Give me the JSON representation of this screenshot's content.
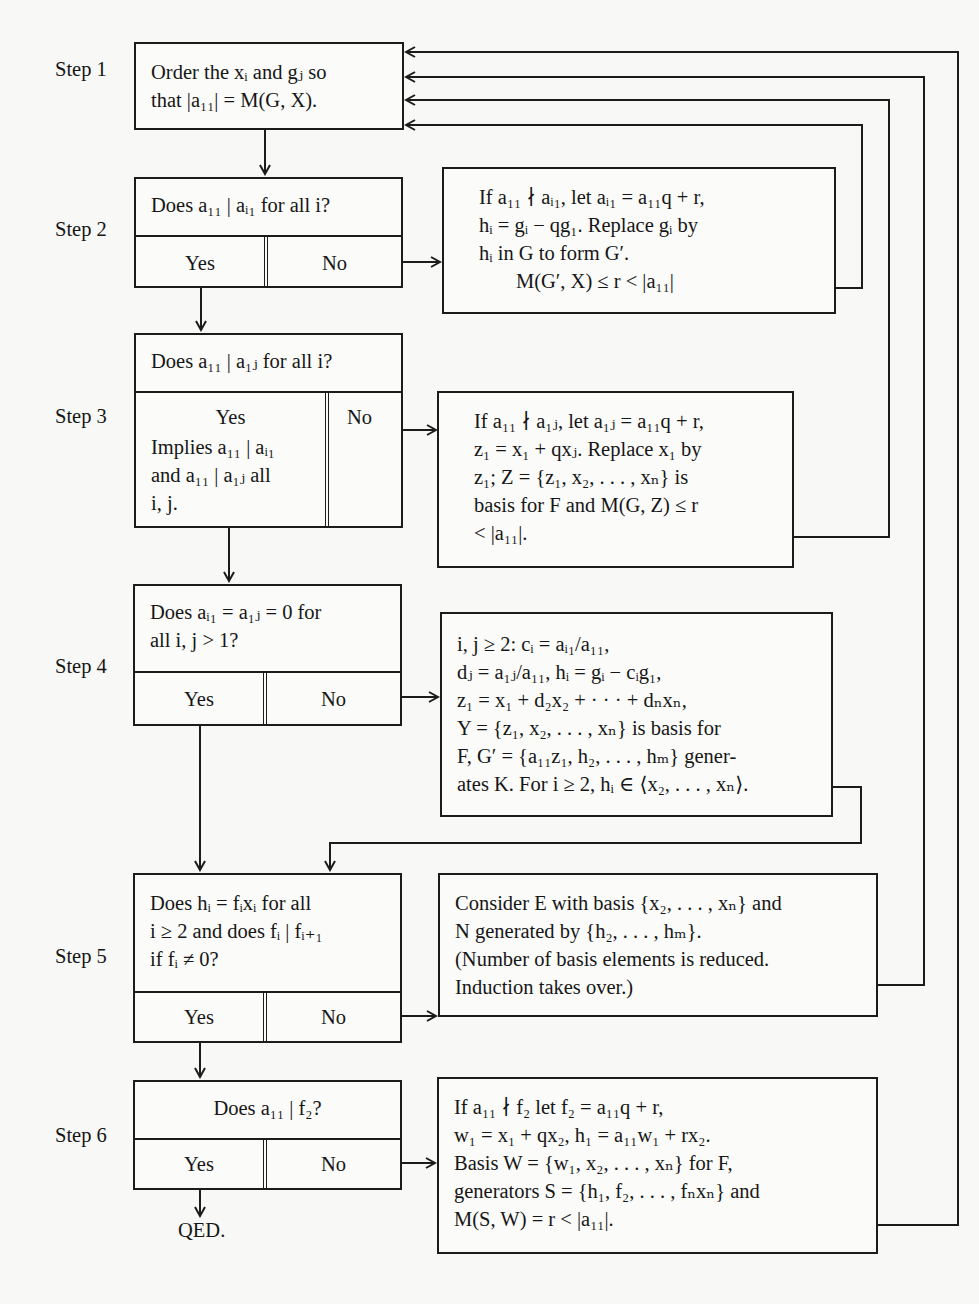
{
  "steps": [
    {
      "label": "Step 1",
      "box": {
        "lines": [
          "Order the xᵢ and gⱼ so",
          "that |a₁₁| = M(G, X)."
        ]
      }
    },
    {
      "label": "Step 2",
      "question": "Does a₁₁ | aᵢ₁ for all i?",
      "yes": "Yes",
      "no": "No",
      "no_action": {
        "lines": [
          "If a₁₁ ∤ aᵢ₁, let aᵢ₁ = a₁₁q + r,",
          "hᵢ = gᵢ − qg₁. Replace gᵢ by",
          "hᵢ in G to form G′.",
          "M(G′, X) ≤ r < |a₁₁|"
        ]
      }
    },
    {
      "label": "Step 3",
      "question": "Does a₁₁ | a₁ⱼ for all i?",
      "yes": "Yes",
      "yes_note": [
        "Implies a₁₁ | aᵢ₁",
        "and a₁₁ | a₁ⱼ all",
        "i, j."
      ],
      "no": "No",
      "no_action": {
        "lines": [
          "If a₁₁ ∤ a₁ⱼ, let a₁ⱼ = a₁₁q + r,",
          "z₁ = x₁ + qxⱼ. Replace x₁ by",
          "z₁; Z = {z₁, x₂, . . . , xₙ} is",
          "basis for F and M(G, Z) ≤ r",
          "< |a₁₁|."
        ]
      }
    },
    {
      "label": "Step 4",
      "question": [
        "Does aᵢ₁ = a₁ⱼ = 0 for",
        "all i, j > 1?"
      ],
      "yes": "Yes",
      "no": "No",
      "no_action": {
        "lines": [
          "i, j ≥ 2: cᵢ = aᵢ₁/a₁₁,",
          "dⱼ = a₁ⱼ/a₁₁, hᵢ = gᵢ − cᵢg₁,",
          "z₁ = x₁ + d₂x₂ + · · · + dₙxₙ,",
          "Y = {z₁, x₂, . . . , xₙ} is basis for",
          "F, G′ = {a₁₁z₁, h₂, . . . , hₘ} gener-",
          "ates K. For i ≥ 2, hᵢ ∈ ⟨x₂, . . . , xₙ⟩."
        ]
      }
    },
    {
      "label": "Step 5",
      "question": [
        "Does  hᵢ = fᵢxᵢ  for  all",
        "i ≥ 2 and does fᵢ | fᵢ₊₁",
        "if fᵢ ≠ 0?"
      ],
      "yes": "Yes",
      "no": "No",
      "no_action": {
        "lines": [
          "Consider E with basis {x₂, . . . , xₙ} and",
          "N generated by {h₂, . . . , hₘ}.",
          "(Number of basis elements is reduced.",
          "Induction takes over.)"
        ]
      }
    },
    {
      "label": "Step 6",
      "question": "Does a₁₁ | f₂?",
      "yes": "Yes",
      "no": "No",
      "no_action": {
        "lines": [
          "If a₁₁ ∤ f₂ let f₂ = a₁₁q + r,",
          "w₁ = x₁ + qx₂, h₁ = a₁₁w₁ + rx₂.",
          "Basis W = {w₁, x₂, . . . , xₙ} for F,",
          "generators S = {h₁, f₂, . . . , fₙxₙ} and",
          "M(S, W) = r < |a₁₁|."
        ]
      }
    }
  ],
  "terminal": "QED.",
  "colors": {
    "ink": "#1c1c1c",
    "paper": "#f8f8f6"
  }
}
